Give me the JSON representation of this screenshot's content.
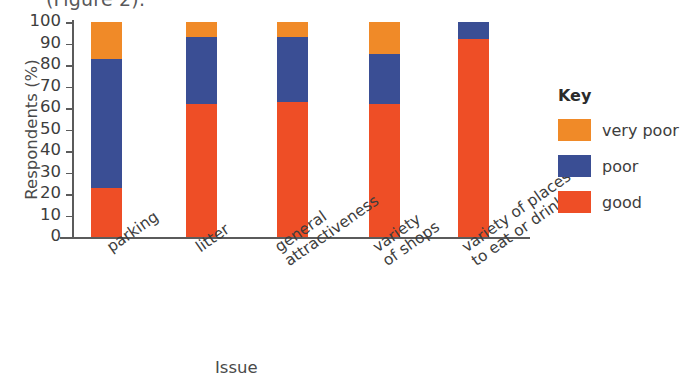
{
  "caption_fragment": "(Figure 2).",
  "chart_data": {
    "type": "bar",
    "subtype": "stacked-bar-100",
    "title": "",
    "xlabel": "Issue",
    "ylabel": "Respondents (%)",
    "ylim": [
      0,
      100
    ],
    "ytick_labels": [
      "0",
      "10",
      "20",
      "30",
      "40",
      "50",
      "60",
      "70",
      "80",
      "90",
      "100"
    ],
    "ytick_values": [
      0,
      10,
      20,
      30,
      40,
      50,
      60,
      70,
      80,
      90,
      100
    ],
    "grid": false,
    "legend_position": "right",
    "legend_title": "Key",
    "categories": [
      "parking",
      "litter",
      "general\nattractiveness",
      "variety\nof shops",
      "variety of places\nto eat or drink"
    ],
    "series": [
      {
        "name": "good",
        "color": "#EE4E26",
        "values": [
          23,
          62,
          63,
          62,
          92
        ]
      },
      {
        "name": "poor",
        "color": "#3A4E94",
        "values": [
          60,
          31,
          30,
          23,
          8
        ]
      },
      {
        "name": "very poor",
        "color": "#F08A28",
        "values": [
          17,
          7,
          7,
          15,
          0
        ]
      }
    ],
    "legend_entries": [
      {
        "label": "very poor",
        "color": "#F08A28"
      },
      {
        "label": "poor",
        "color": "#3A4E94"
      },
      {
        "label": "good",
        "color": "#EE4E26"
      }
    ]
  }
}
